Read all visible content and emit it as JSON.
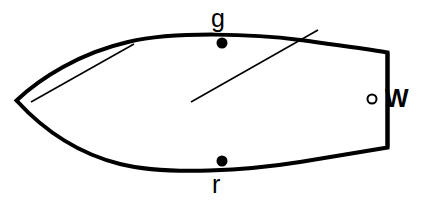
{
  "figure": {
    "kind": "boat-hull-plan-view-diagram",
    "background_color": "#ffffff",
    "stroke_color": "#000000",
    "width": 421,
    "height": 201
  },
  "labels": {
    "green_marker": "g",
    "red_marker": "r",
    "white_marker": "W"
  },
  "markers": {
    "green_dot": {
      "cx": 222,
      "cy": 43,
      "r": 5.5,
      "fill": "#000000"
    },
    "red_dot": {
      "cx": 222,
      "cy": 161,
      "r": 5.5,
      "fill": "#000000"
    },
    "white_circle": {
      "cx": 372,
      "cy": 99,
      "r": 4.5,
      "fill": "none",
      "stroke": "#000000"
    }
  },
  "geometry": {
    "hull_outline_path": "M 16.5 100.5 C 40 78 80 53 128 42 C 175 31 255 34 300 40 C 330 44 362 48 387.5 52.5 L 387.5 147.5 C 362 152 330 157 300 162 C 250 170 168 176 120 164 C 72 152 38 124 16.5 100.5 Z",
    "transom_line": {
      "x1": 387.5,
      "y1": 52.5,
      "x2": 387.5,
      "y2": 147.5
    },
    "sheer_inner_line": {
      "x1": 31,
      "y1": 102,
      "x2": 134,
      "y2": 44
    },
    "bearing_line": {
      "x1": 191,
      "y1": 102,
      "x2": 318,
      "y2": 30
    },
    "hull_stroke_width": 4,
    "thin_stroke_width": 1.6
  }
}
